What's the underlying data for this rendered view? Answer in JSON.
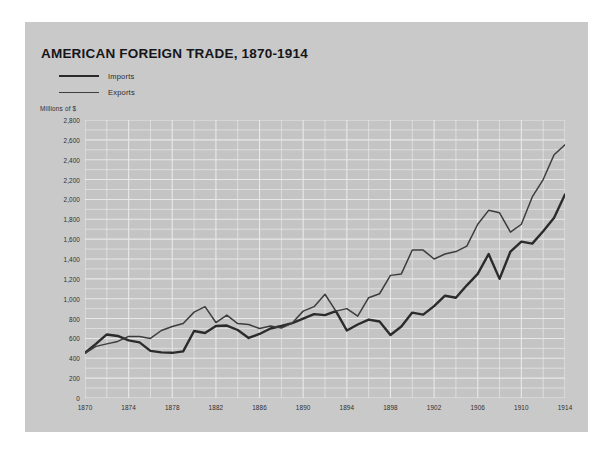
{
  "card": {
    "background_color": "#c9c9c9",
    "plot_background_color": "#c4c4c4",
    "gridline_color": "#e8e8e8"
  },
  "header": {
    "title": "AMERICAN FOREIGN TRADE, 1870-1914",
    "axis_unit_label": "Millions of $"
  },
  "legend": {
    "items": [
      {
        "label": "Imports",
        "style": "thick",
        "color": "#2b2b2b"
      },
      {
        "label": "Exports",
        "style": "thin",
        "color": "#3d3d3d"
      }
    ]
  },
  "chart_data": {
    "type": "line",
    "title": "AMERICAN FOREIGN TRADE, 1870-1914",
    "xlabel": "",
    "ylabel": "Millions of $",
    "xlim": [
      1870,
      1914
    ],
    "ylim": [
      0,
      2800
    ],
    "ytick_step": 200,
    "yminor_step": 100,
    "xtick_step": 4,
    "xgrid_step": 2,
    "grid": true,
    "legend_position": "top-left",
    "ytick_labels": [
      "0",
      "200",
      "400",
      "600",
      "800",
      "1,000",
      "1,200",
      "1,400",
      "1,600",
      "1,800",
      "2,000",
      "2,200",
      "2,400",
      "2,600",
      "2,800"
    ],
    "ytick_values": [
      0,
      200,
      400,
      600,
      800,
      1000,
      1200,
      1400,
      1600,
      1800,
      2000,
      2200,
      2400,
      2600,
      2800
    ],
    "xtick_labels": [
      "1870",
      "1874",
      "1878",
      "1882",
      "1886",
      "1890",
      "1894",
      "1898",
      "1902",
      "1906",
      "1910",
      "1914"
    ],
    "xtick_values": [
      1870,
      1874,
      1878,
      1882,
      1886,
      1890,
      1894,
      1898,
      1902,
      1906,
      1910,
      1914
    ],
    "x": [
      1870,
      1871,
      1872,
      1873,
      1874,
      1875,
      1876,
      1877,
      1878,
      1879,
      1880,
      1881,
      1882,
      1883,
      1884,
      1885,
      1886,
      1887,
      1888,
      1889,
      1890,
      1891,
      1892,
      1893,
      1894,
      1895,
      1896,
      1897,
      1898,
      1899,
      1900,
      1901,
      1902,
      1903,
      1904,
      1905,
      1906,
      1907,
      1908,
      1909,
      1910,
      1911,
      1912,
      1913,
      1914
    ],
    "series": [
      {
        "name": "Imports",
        "style": "thick",
        "color": "#2b2b2b",
        "values": [
          455,
          545,
          640,
          625,
          580,
          560,
          475,
          460,
          455,
          470,
          675,
          655,
          725,
          730,
          685,
          605,
          645,
          700,
          725,
          755,
          800,
          845,
          835,
          875,
          680,
          740,
          790,
          770,
          635,
          720,
          860,
          840,
          925,
          1030,
          1010,
          1135,
          1250,
          1450,
          1200,
          1475,
          1575,
          1555,
          1680,
          1815,
          2050
        ]
      },
      {
        "name": "Exports",
        "style": "thin",
        "color": "#3d3d3d",
        "values": [
          450,
          520,
          545,
          570,
          620,
          620,
          600,
          680,
          720,
          750,
          865,
          920,
          760,
          835,
          750,
          740,
          700,
          725,
          705,
          755,
          875,
          920,
          1045,
          875,
          900,
          825,
          1010,
          1050,
          1235,
          1250,
          1490,
          1490,
          1400,
          1450,
          1475,
          1530,
          1750,
          1890,
          1865,
          1670,
          1750,
          2025,
          2200,
          2450,
          2550
        ]
      }
    ]
  }
}
